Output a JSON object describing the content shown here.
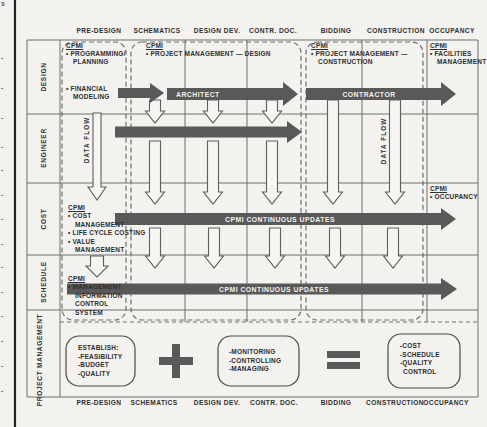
{
  "colors": {
    "bar": "#595959",
    "grid_line": "#6e6e6e",
    "text": "#2f2f2f",
    "paper": "#f3f2ee",
    "arrow_fill": "#f6f5f1"
  },
  "phases": [
    "PRE-DESIGN",
    "SCHEMATICS",
    "DESIGN DEV.",
    "CONTR. DOC.",
    "BIDDING",
    "CONSTRUCTION",
    "OCCUPANCY"
  ],
  "disciplines": [
    "DESIGN",
    "ENGINEER",
    "COST",
    "SCHEDULE"
  ],
  "pm_row_label": [
    "PROJECT",
    "MANAGEMENT"
  ],
  "design_row": {
    "predesign": {
      "heading": "CPMI",
      "lines": [
        "• PROGRAMMING/",
        "PLANNING"
      ],
      "financial": [
        "• FINANCIAL",
        "MODELING"
      ]
    },
    "design_phase": {
      "heading": "CPMI",
      "line": "• PROJECT MANAGEMENT — DESIGN"
    },
    "construction_phase": {
      "heading": "CPMI",
      "lines": [
        "• PROJECT MANAGEMENT —",
        "CONSTRUCTION"
      ]
    },
    "occupancy": {
      "heading": "CPMI",
      "lines": [
        "• FACILITIES",
        "MANAGEMENT"
      ]
    }
  },
  "arrows": {
    "architect": "ARCHITECT",
    "contractor": "CONTRACTOR",
    "continuous_updates": "CPMI CONTINUOUS UPDATES",
    "data_flow": "DATA FLOW"
  },
  "cost_row": {
    "predesign": {
      "heading": "CPMI",
      "lines": [
        "• COST",
        "MANAGEMENT",
        "• LIFE CYCLE COSTING",
        "• VALUE",
        "MANAGEMENT"
      ]
    },
    "occupancy": {
      "heading": "CPMI",
      "line": "• OCCUPANCY"
    }
  },
  "schedule_row": {
    "predesign": {
      "heading": "CPMI",
      "lines": [
        "• MANAGEMENT",
        "INFORMATION",
        "CONTROL",
        "SYSTEM"
      ]
    }
  },
  "pm_band": {
    "establish": [
      "ESTABLISH:",
      "-FEASIBILITY",
      "-BUDGET",
      "-QUALITY"
    ],
    "monitor": [
      "-MONITORING",
      "-CONTROLLING",
      "-MANAGING"
    ],
    "result": [
      "-COST",
      "-SCHEDULE",
      "-QUALITY",
      "CONTROL"
    ]
  },
  "edge_marks": {
    "top_fragment": "s",
    "dash": "-",
    "ys": [
      54,
      84,
      114,
      143,
      166,
      191,
      215,
      240,
      263,
      288,
      312,
      337,
      362,
      387
    ]
  }
}
